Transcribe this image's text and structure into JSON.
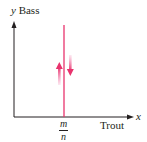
{
  "diagram": {
    "y_axis": {
      "variable": "y",
      "label": "Bass"
    },
    "x_axis": {
      "variable": "x",
      "label": "Trout"
    },
    "vertical_line": {
      "label_numerator": "m",
      "label_denominator": "n",
      "color": "#e8336d"
    },
    "arrows": [
      {
        "direction": "up",
        "color": "#f06aa0"
      },
      {
        "direction": "down",
        "color": "#f06aa0"
      }
    ],
    "colors": {
      "axis": "#231f20",
      "line": "#e8336d",
      "arrow": "#f06aa0"
    }
  }
}
